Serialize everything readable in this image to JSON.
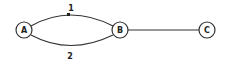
{
  "diagram": {
    "type": "graph",
    "nodes": [
      {
        "id": "A",
        "label": "A",
        "cx": 24,
        "cy": 30,
        "r": 8
      },
      {
        "id": "B",
        "label": "B",
        "cx": 120,
        "cy": 30,
        "r": 8
      },
      {
        "id": "C",
        "label": "C",
        "cx": 207,
        "cy": 30,
        "r": 8
      }
    ],
    "edges": [
      {
        "id": "e1",
        "from": "A",
        "to": "B",
        "label": "1",
        "shape": "curve-up",
        "marker": "midpoint-tick"
      },
      {
        "id": "e2",
        "from": "A",
        "to": "B",
        "label": "2",
        "shape": "curve-down"
      },
      {
        "id": "e3",
        "from": "B",
        "to": "C",
        "label": "",
        "shape": "straight"
      }
    ],
    "colors": {
      "stroke": "#333333",
      "text": "#222222",
      "background": "#ffffff"
    }
  }
}
